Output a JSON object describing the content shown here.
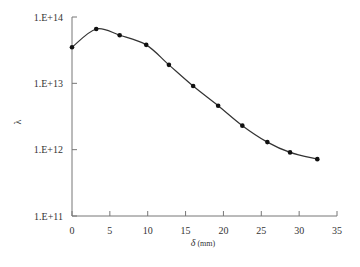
{
  "chart_data": {
    "type": "line",
    "title": "",
    "xlabel": "δ (mm)",
    "xlabel_symbol": "δ",
    "xlabel_unit": "(mm)",
    "ylabel": "λ",
    "xlim": [
      0,
      35
    ],
    "ylim": [
      100000000000.0,
      100000000000000.0
    ],
    "yscale": "log",
    "grid": false,
    "legend": null,
    "x_ticks": [
      0,
      5,
      10,
      15,
      20,
      25,
      30,
      35
    ],
    "x_tick_labels": [
      "0",
      "5",
      "10",
      "15",
      "20",
      "25",
      "30",
      "35"
    ],
    "y_ticks": [
      100000000000.0,
      1000000000000.0,
      10000000000000.0,
      100000000000000.0
    ],
    "y_tick_labels": [
      "1.E+11",
      "1.E+12",
      "1.E+13",
      "1.E+14"
    ],
    "series": [
      {
        "name": "λ",
        "marker": "circle",
        "line": "smooth",
        "color": "#1a1a1a",
        "x": [
          0,
          3.2,
          6.3,
          9.8,
          12.8,
          16.0,
          19.3,
          22.5,
          25.8,
          28.8,
          32.4
        ],
        "y": [
          35000000000000.0,
          66000000000000.0,
          53000000000000.0,
          38000000000000.0,
          19000000000000.0,
          9100000000000.0,
          4600000000000.0,
          2300000000000.0,
          1300000000000.0,
          910000000000.0,
          720000000000.0
        ]
      }
    ]
  },
  "colors": {
    "axis": "#777777",
    "line": "#333333",
    "marker": "#111111",
    "text": "#333333"
  }
}
